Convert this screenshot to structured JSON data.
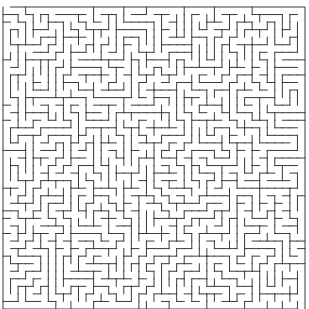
{
  "maze": {
    "cols": 40,
    "rows": 40,
    "origin_x": 3,
    "origin_y": 7,
    "cell_size": 7.55,
    "wall_color": "#3a3a3a",
    "background": "#ffffff",
    "wall_width": 1,
    "seed": 20240917,
    "entrance": {
      "side": "top",
      "col": 0
    },
    "exit": {
      "side": "bottom",
      "col": 39
    }
  }
}
